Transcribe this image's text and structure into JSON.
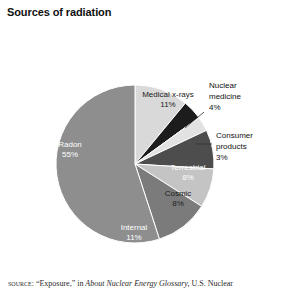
{
  "figure": {
    "title": "Sources of radiation",
    "source_note_prefix": "source:",
    "source_note_quoted": "“Exposure,”",
    "source_note_connector": "in",
    "source_note_italic_title": "About Nuclear Energy Glossary,",
    "source_note_tail": "U.S. Nuclear"
  },
  "chart_data": {
    "type": "pie",
    "title": "Sources of radiation",
    "xlabel": "",
    "ylabel": "",
    "units": "percent",
    "total": 100,
    "legend": "none (labels drawn on slices and via leader lines)",
    "start_angle_deg": 0,
    "direction": "clockwise",
    "categories": [
      "Medical x-rays",
      "Nuclear medicine",
      "Consumer products",
      "Terrestrial",
      "Cosmic",
      "Internal",
      "Radon"
    ],
    "values": [
      11,
      4,
      3,
      8,
      8,
      11,
      55
    ],
    "slices": [
      {
        "name": "Medical x-rays",
        "label": "Medical x-rays",
        "percent_text": "11%",
        "value": 11,
        "color": "#d9d9d9",
        "label_placement": "inside",
        "label_text_color": "dark"
      },
      {
        "name": "Nuclear medicine",
        "label": "Nuclear medicine",
        "label_line1": "Nuclear",
        "label_line2": "medicine",
        "percent_text": "4%",
        "value": 4,
        "color": "#1c1c1c",
        "label_placement": "callout",
        "label_text_color": "dark"
      },
      {
        "name": "Consumer products",
        "label": "Consumer products",
        "label_line1": "Consumer",
        "label_line2": "products",
        "percent_text": "3%",
        "value": 3,
        "color": "#e2e2e2",
        "label_placement": "callout",
        "label_text_color": "dark"
      },
      {
        "name": "Terrestrial",
        "label": "Terrestrial",
        "percent_text": "8%",
        "value": 8,
        "color": "#4d4d4d",
        "label_placement": "inside",
        "label_text_color": "light"
      },
      {
        "name": "Cosmic",
        "label": "Cosmic",
        "percent_text": "8%",
        "value": 8,
        "color": "#c4c4c4",
        "label_placement": "inside",
        "label_text_color": "dark"
      },
      {
        "name": "Internal",
        "label": "Internal",
        "percent_text": "11%",
        "value": 11,
        "color": "#7b7b7b",
        "label_placement": "inside",
        "label_text_color": "light"
      },
      {
        "name": "Radon",
        "label": "Radon",
        "percent_text": "55%",
        "value": 55,
        "color": "#8e8e8e",
        "label_placement": "inside",
        "label_text_color": "light"
      }
    ]
  }
}
